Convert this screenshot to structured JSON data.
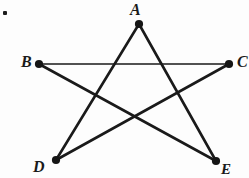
{
  "figure": {
    "kind": "pentagram-diagram",
    "background_color": "#fdfdfd",
    "ink_color": "#1a1a1a",
    "bullet_marker": "list-bullet-square",
    "vertices": [
      {
        "id": "A",
        "label": "A",
        "x": 139,
        "y": 24,
        "label_position": "above"
      },
      {
        "id": "B",
        "label": "B",
        "x": 39,
        "y": 64,
        "label_position": "left"
      },
      {
        "id": "C",
        "label": "C",
        "x": 229,
        "y": 64,
        "label_position": "right-cropped"
      },
      {
        "id": "D",
        "label": "D",
        "x": 56,
        "y": 160,
        "label_position": "below-left-cropped"
      },
      {
        "id": "E",
        "label": "E",
        "x": 216,
        "y": 161,
        "label_position": "below-right-cropped"
      }
    ],
    "edges": [
      {
        "from": "B",
        "to": "C",
        "stroke_width": 1.4
      },
      {
        "from": "A",
        "to": "D",
        "stroke_width": 2.6
      },
      {
        "from": "A",
        "to": "E",
        "stroke_width": 2.6
      },
      {
        "from": "B",
        "to": "E",
        "stroke_width": 2.6
      },
      {
        "from": "C",
        "to": "D",
        "stroke_width": 2.6
      }
    ],
    "dot_radius": 3.6
  }
}
